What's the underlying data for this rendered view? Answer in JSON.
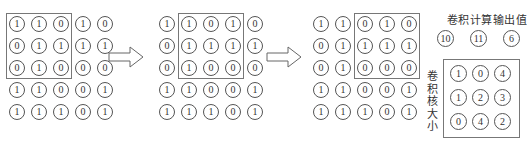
{
  "diagram": {
    "input_matrix": [
      [
        "1",
        "1",
        "0",
        "1",
        "0"
      ],
      [
        "0",
        "1",
        "1",
        "1",
        "1"
      ],
      [
        "0",
        "1",
        "0",
        "0",
        "0"
      ],
      [
        "1",
        "1",
        "0",
        "0",
        "1"
      ],
      [
        "1",
        "1",
        "1",
        "0",
        "1"
      ]
    ],
    "steps": [
      {
        "window_cols": [
          0,
          2
        ],
        "window_rows": [
          0,
          2
        ]
      },
      {
        "window_cols": [
          1,
          3
        ],
        "window_rows": [
          0,
          2
        ]
      },
      {
        "window_cols": [
          2,
          4
        ],
        "window_rows": [
          0,
          2
        ]
      }
    ],
    "output_title": "卷积计算输出值",
    "output_values": [
      "10",
      "11",
      "6"
    ],
    "kernel_label": "卷积核大小",
    "kernel": [
      [
        "1",
        "0",
        "4"
      ],
      [
        "1",
        "2",
        "3"
      ],
      [
        "0",
        "4",
        "2"
      ]
    ],
    "arrow_icon": "right-arrow-icon",
    "colors": {
      "stroke": "#555555",
      "box": "#777777",
      "text": "#333333"
    }
  }
}
